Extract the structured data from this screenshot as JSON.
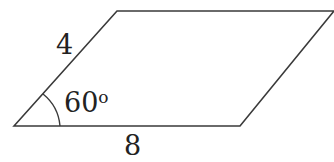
{
  "diagram": {
    "shape": "parallelogram",
    "side_label_slanted": "4",
    "side_label_base": "8",
    "angle_label": "60",
    "angle_degree_symbol": "o",
    "stroke_color": "#333333",
    "text_color": "#222222"
  }
}
